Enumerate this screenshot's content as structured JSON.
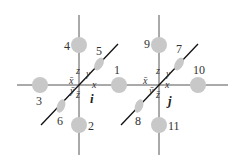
{
  "diagram": {
    "nodes": [
      {
        "id": "i",
        "label": "i",
        "cx": 79,
        "cy": 85
      },
      {
        "id": "j",
        "label": "j",
        "cx": 159,
        "cy": 85
      }
    ],
    "neighbors": [
      {
        "label": "1",
        "cx": 119,
        "cy": 85
      },
      {
        "label": "2",
        "cx": 79,
        "cy": 125
      },
      {
        "label": "3",
        "cx": 40,
        "cy": 85
      },
      {
        "label": "4",
        "cx": 79,
        "cy": 45
      },
      {
        "label": "5",
        "cx": 99,
        "cy": 64
      },
      {
        "label": "6",
        "cx": 61,
        "cy": 106
      },
      {
        "label": "7",
        "cx": 179,
        "cy": 64
      },
      {
        "label": "8",
        "cx": 139,
        "cy": 106
      },
      {
        "label": "9",
        "cx": 159,
        "cy": 45
      },
      {
        "label": "10",
        "cx": 198,
        "cy": 85
      },
      {
        "label": "11",
        "cx": 159,
        "cy": 125
      }
    ],
    "axis_labels": {
      "x": "x",
      "y": "y",
      "z": "z",
      "x_bar": "x̄",
      "y_bar": "ȳ",
      "z_bar": "z̄"
    },
    "colors": {
      "circle": "#c8c8c8",
      "line": "#444444",
      "diag_line": "#111111"
    }
  }
}
